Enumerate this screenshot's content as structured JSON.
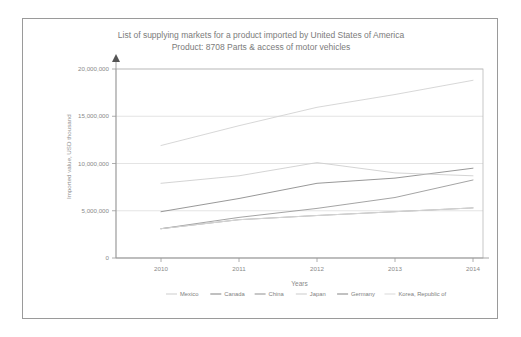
{
  "chart_data": {
    "type": "line",
    "title": "List of supplying markets for a product imported by United States of America",
    "subtitle": "Product: 8708 Parts & access of motor vehicles",
    "xlabel": "Years",
    "ylabel": "Imported value, USD thousand",
    "categories": [
      "2010",
      "2011",
      "2012",
      "2013",
      "2014"
    ],
    "x": [
      2010,
      2011,
      2012,
      2013,
      2014
    ],
    "ylim": [
      0,
      20000000
    ],
    "yticks": [
      0,
      5000000,
      10000000,
      15000000,
      20000000
    ],
    "ytick_labels": [
      "0",
      "5,000,000",
      "10,000,000",
      "15,000,000",
      "20,000,000"
    ],
    "grid": true,
    "legend_position": "bottom",
    "series": [
      {
        "name": "Mexico",
        "color": "#d2d2d2",
        "values": [
          11900000,
          14000000,
          15950000,
          17300000,
          18800000
        ]
      },
      {
        "name": "Canada",
        "color": "#8c8c8c",
        "values": [
          4900000,
          6300000,
          7900000,
          8450000,
          9500000
        ]
      },
      {
        "name": "China",
        "color": "#9a9a9a",
        "values": [
          3100000,
          4300000,
          5250000,
          6400000,
          8250000
        ]
      },
      {
        "name": "Japan",
        "color": "#cfcfcf",
        "values": [
          7900000,
          8700000,
          10100000,
          9000000,
          8700000
        ]
      },
      {
        "name": "Germany",
        "color": "#8f8f8f",
        "values": [
          3100000,
          4050000,
          4500000,
          4900000,
          5300000
        ]
      },
      {
        "name": "Korea, Republic of",
        "color": "#dcdcdc",
        "values": [
          3100000,
          4050000,
          4500000,
          4900000,
          5300000
        ]
      }
    ]
  },
  "legend": {
    "items": [
      {
        "label": "Mexico"
      },
      {
        "label": "Canada"
      },
      {
        "label": "China"
      },
      {
        "label": "Japan"
      },
      {
        "label": "Germany"
      },
      {
        "label": "Korea, Republic of"
      }
    ]
  }
}
